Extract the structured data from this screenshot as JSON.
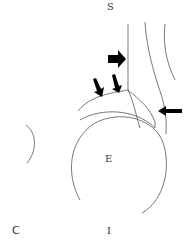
{
  "labels": {
    "superior": "S",
    "inferior": "I",
    "center": "E",
    "corner": "C"
  },
  "colors": {
    "line": "#555555",
    "arrow": "#000000",
    "text": "#333333"
  }
}
